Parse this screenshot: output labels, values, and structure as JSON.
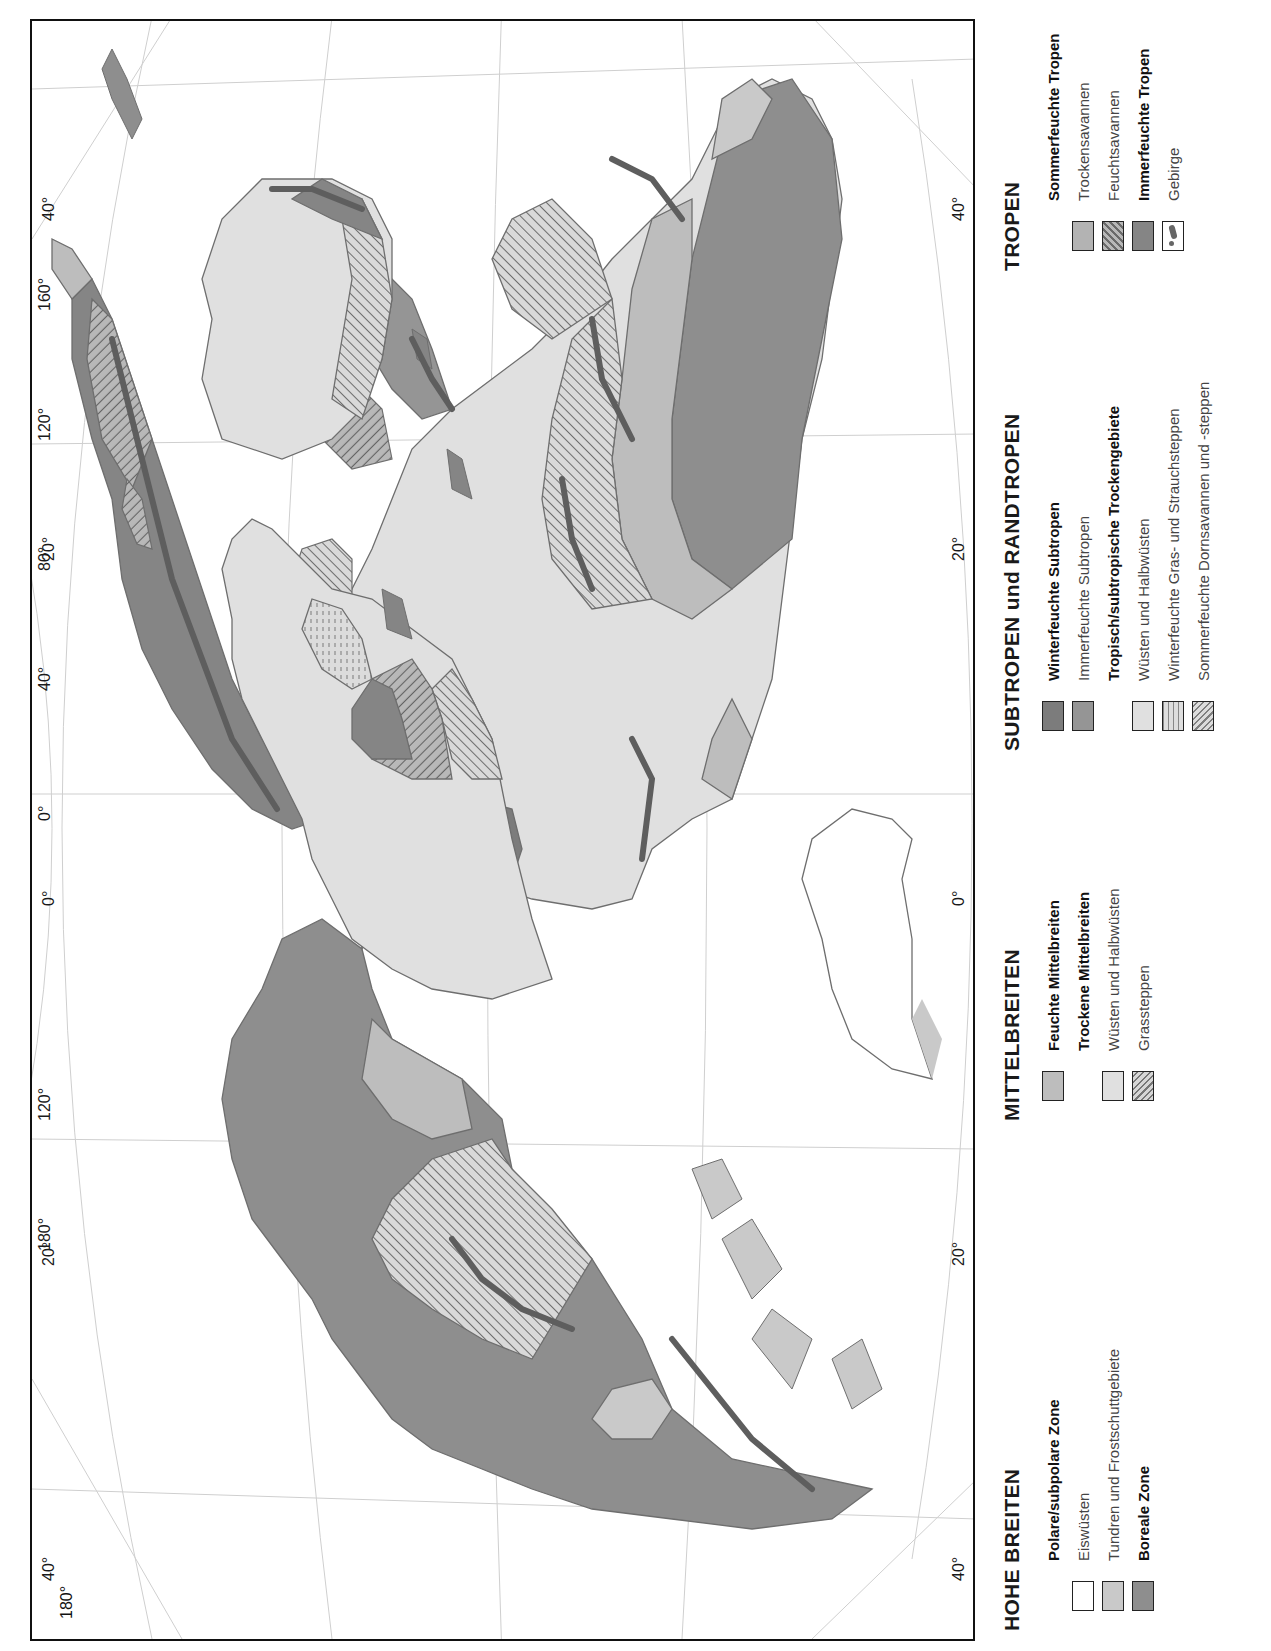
{
  "map": {
    "orientation": "rotated 90 degrees counter-clockwise",
    "meridian_labels_top": [
      "40°",
      "20°",
      "0°",
      "20°",
      "40°"
    ],
    "meridian_labels_bottom": [
      "40°",
      "20°",
      "0°",
      "20°",
      "40°"
    ],
    "longitude_labels": [
      "180°",
      "120°",
      "0°",
      "40°",
      "80°",
      "120°",
      "160°"
    ],
    "parallel_labels_inner": [
      "60°",
      "60°"
    ],
    "colors": {
      "frame": "#111111",
      "graticule": "#c8c8c8",
      "coast": "#6e6e6e",
      "mountain": "#5e5e5e"
    }
  },
  "legend": {
    "hohe_breiten": {
      "title": "HOHE BREITEN",
      "group": "Polare/subpolare Zone",
      "items": [
        {
          "label": "Eiswüsten",
          "swatch": "#ffffff"
        },
        {
          "label": "Tundren und Frostschuttgebiete",
          "swatch": "#c9c9c9"
        }
      ],
      "boreal": {
        "label": "Boreale Zone",
        "swatch": "#8e8e8e"
      }
    },
    "mittelbreiten": {
      "title": "MITTELBREITEN",
      "feucht": {
        "label": "Feuchte Mittelbreiten",
        "swatch": "#bdbdbd"
      },
      "group": "Trockene Mittelbreiten",
      "items": [
        {
          "label": "Wüsten und Halbwüsten",
          "swatch": "#e0e0e0"
        },
        {
          "label": "Grassteppen",
          "swatch": "hatched"
        }
      ]
    },
    "subtropen": {
      "title": "SUBTROPEN und RANDTROPEN",
      "winterfeucht": {
        "label": "Winterfeuchte Subtropen",
        "swatch": "#7c7c7c"
      },
      "immerfeucht": {
        "label": "Immerfeuchte Subtropen",
        "swatch": "#959595"
      },
      "group": "Tropisch/subtropische Trockengebiete",
      "items": [
        {
          "label": "Wüsten und Halbwüsten",
          "swatch": "#e0e0e0"
        },
        {
          "label": "Winterfeuchte Gras- und Strauchsteppen",
          "swatch": "dashed"
        },
        {
          "label": "Sommerfeuchte Dornsavannen und -steppen",
          "swatch": "hatched"
        }
      ]
    },
    "tropen": {
      "title": "TROPEN",
      "group": "Sommerfeuchte Tropen",
      "items": [
        {
          "label": "Trockensavannen",
          "swatch": "#b3b3b3"
        },
        {
          "label": "Feuchtsavannen",
          "swatch": "hatched"
        }
      ],
      "immerfeucht": {
        "label": "Immerfeuchte Tropen",
        "swatch": "#858585"
      },
      "gebirge": {
        "label": "Gebirge",
        "swatch": "mountain-symbol"
      }
    }
  }
}
